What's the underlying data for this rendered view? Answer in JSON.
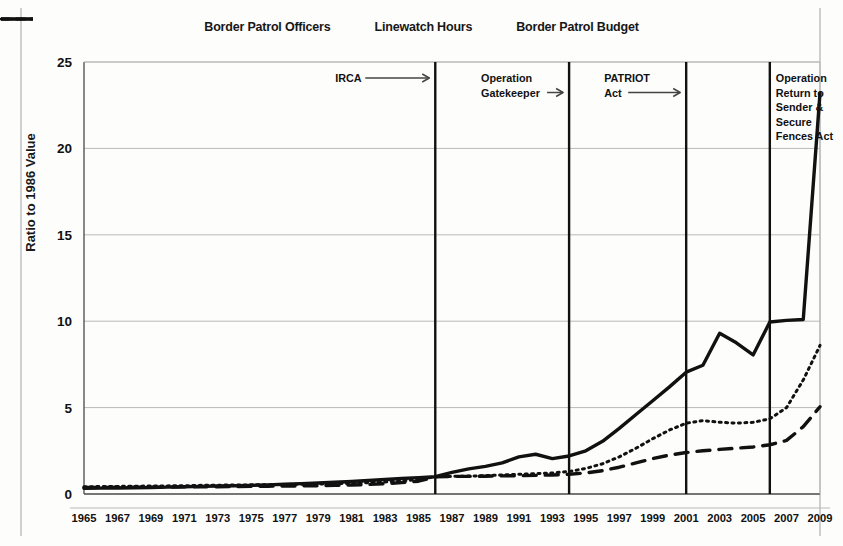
{
  "chart_data": {
    "type": "line",
    "title": "",
    "xlabel": "",
    "ylabel": "Ratio to 1986 Value",
    "xlim": [
      1965,
      2009
    ],
    "ylim": [
      0,
      25
    ],
    "yticks": [
      0,
      5,
      10,
      15,
      20,
      25
    ],
    "grid": true,
    "legend_position": "top-center",
    "x": [
      1965,
      1966,
      1967,
      1968,
      1969,
      1970,
      1971,
      1972,
      1973,
      1974,
      1975,
      1976,
      1977,
      1978,
      1979,
      1980,
      1981,
      1982,
      1983,
      1984,
      1985,
      1986,
      1987,
      1988,
      1989,
      1990,
      1991,
      1992,
      1993,
      1994,
      1995,
      1996,
      1997,
      1998,
      1999,
      2000,
      2001,
      2002,
      2003,
      2004,
      2005,
      2006,
      2007,
      2008,
      2009
    ],
    "xticklabels": [
      "1965",
      "1967",
      "1969",
      "1971",
      "1973",
      "1975",
      "1977",
      "1979",
      "1981",
      "1983",
      "1985",
      "1987",
      "1989",
      "1991",
      "1993",
      "1995",
      "1997",
      "1999",
      "2001",
      "2003",
      "2005",
      "2007",
      "2009"
    ],
    "series": [
      {
        "name": "Border Patrol Officers",
        "style": "dashed",
        "color": "#111111",
        "values": [
          0.38,
          0.38,
          0.39,
          0.39,
          0.4,
          0.4,
          0.41,
          0.42,
          0.42,
          0.43,
          0.44,
          0.45,
          0.46,
          0.47,
          0.48,
          0.5,
          0.52,
          0.55,
          0.6,
          0.66,
          0.74,
          1.0,
          1.02,
          1.02,
          1.03,
          1.05,
          1.06,
          1.08,
          1.1,
          1.14,
          1.22,
          1.35,
          1.55,
          1.8,
          2.05,
          2.25,
          2.4,
          2.5,
          2.58,
          2.65,
          2.72,
          2.85,
          3.1,
          3.9,
          5.05
        ]
      },
      {
        "name": "Linewatch Hours",
        "style": "dotted",
        "color": "#111111",
        "values": [
          0.42,
          0.43,
          0.44,
          0.45,
          0.46,
          0.47,
          0.48,
          0.5,
          0.51,
          0.52,
          0.53,
          0.54,
          0.55,
          0.57,
          0.58,
          0.6,
          0.62,
          0.66,
          0.7,
          0.76,
          0.84,
          1.0,
          1.02,
          1.04,
          1.06,
          1.1,
          1.14,
          1.18,
          1.22,
          1.3,
          1.48,
          1.75,
          2.15,
          2.65,
          3.2,
          3.7,
          4.1,
          4.25,
          4.15,
          4.1,
          4.15,
          4.35,
          5.0,
          6.6,
          8.6
        ]
      },
      {
        "name": "Border Patrol Budget",
        "style": "solid",
        "color": "#111111",
        "values": [
          0.33,
          0.34,
          0.35,
          0.36,
          0.38,
          0.4,
          0.42,
          0.44,
          0.46,
          0.48,
          0.5,
          0.53,
          0.56,
          0.6,
          0.64,
          0.68,
          0.72,
          0.78,
          0.84,
          0.9,
          0.95,
          1.0,
          1.25,
          1.45,
          1.6,
          1.8,
          2.15,
          2.3,
          2.05,
          2.2,
          2.5,
          3.05,
          3.8,
          4.6,
          5.4,
          6.2,
          7.05,
          7.45,
          9.3,
          8.75,
          8.05,
          9.95,
          10.05,
          10.1,
          23.2
        ]
      }
    ],
    "annotations": [
      {
        "label": "IRCA",
        "year": 1986,
        "lines": [
          "IRCA"
        ],
        "arrow": true
      },
      {
        "label": "Operation Gatekeeper",
        "year": 1994,
        "lines": [
          "Operation",
          "Gatekeeper"
        ],
        "arrow": true
      },
      {
        "label": "PATRIOT Act",
        "year": 2001,
        "lines": [
          "PATRIOT",
          "Act"
        ],
        "arrow": true
      },
      {
        "label": "Operation Return to Sender & Secure Fences Act",
        "year": 2006,
        "lines": [
          "Operation",
          "Return to",
          "Sender &",
          "Secure",
          "Fences Act"
        ],
        "arrow": true
      }
    ]
  },
  "legend": {
    "items": [
      {
        "label": "Border Patrol Officers",
        "style": "dashed"
      },
      {
        "label": "Linewatch Hours",
        "style": "dotted"
      },
      {
        "label": "Border Patrol Budget",
        "style": "solid"
      }
    ]
  },
  "axis": {
    "y_title": "Ratio to 1986 Value"
  }
}
